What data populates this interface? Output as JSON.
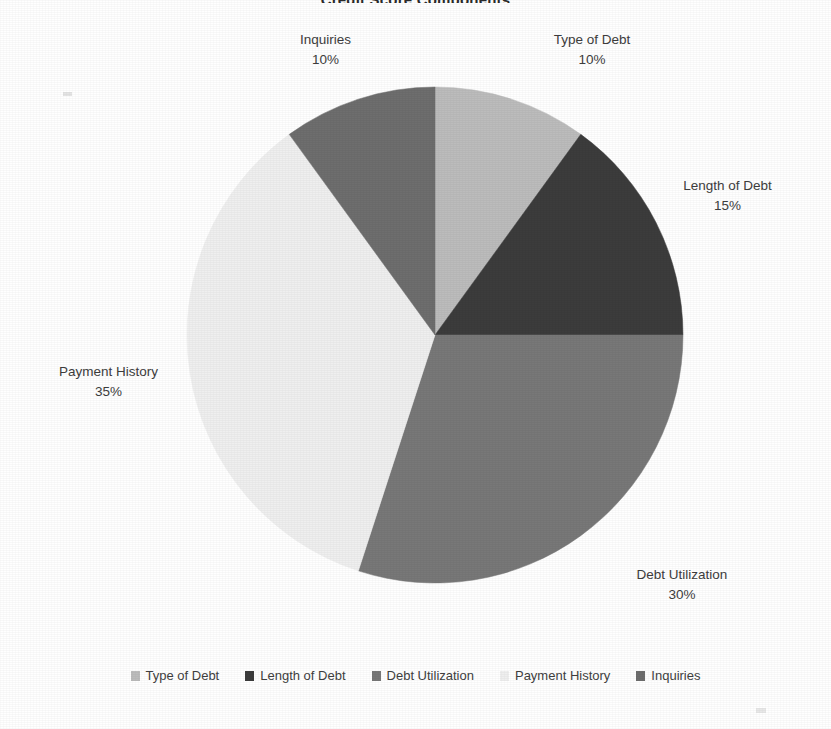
{
  "title": "Credit Score Components",
  "chart_data": {
    "type": "pie",
    "title": "Credit Score Components",
    "categories": [
      "Type of Debt",
      "Length of Debt",
      "Debt Utilization",
      "Payment History",
      "Inquiries"
    ],
    "values": [
      10,
      15,
      30,
      35,
      10
    ],
    "value_labels": [
      "10%",
      "15%",
      "30%",
      "35%",
      "10%"
    ],
    "unit": "%",
    "start_angle_deg": 0,
    "direction": "clockwise",
    "legend_position": "bottom",
    "grid": false,
    "colors": [
      "#bcbcbc",
      "#3c3c3c",
      "#787878",
      "#efefef",
      "#6e6e6e"
    ],
    "slices": [
      {
        "label": "Type of Debt",
        "value": 10,
        "value_label": "10%",
        "color": "#bcbcbc",
        "start_deg": 0,
        "end_deg": 36
      },
      {
        "label": "Length of Debt",
        "value": 15,
        "value_label": "15%",
        "color": "#3c3c3c",
        "start_deg": 36,
        "end_deg": 90
      },
      {
        "label": "Debt Utilization",
        "value": 30,
        "value_label": "30%",
        "color": "#787878",
        "start_deg": 90,
        "end_deg": 198
      },
      {
        "label": "Payment History",
        "value": 35,
        "value_label": "35%",
        "color": "#efefef",
        "start_deg": 198,
        "end_deg": 324
      },
      {
        "label": "Inquiries",
        "value": 10,
        "value_label": "10%",
        "color": "#6e6e6e",
        "start_deg": 324,
        "end_deg": 360
      }
    ]
  },
  "labels": {
    "type_of_debt": {
      "name": "Type of Debt",
      "pct": "10%"
    },
    "length_of_debt": {
      "name": "Length of Debt",
      "pct": "15%"
    },
    "debt_utilization": {
      "name": "Debt Utilization",
      "pct": "30%"
    },
    "payment_history": {
      "name": "Payment History",
      "pct": "35%"
    },
    "inquiries": {
      "name": "Inquiries",
      "pct": "10%"
    }
  },
  "legend": {
    "items": [
      {
        "label": "Type of Debt",
        "color": "#bcbcbc"
      },
      {
        "label": "Length of Debt",
        "color": "#3c3c3c"
      },
      {
        "label": "Debt Utilization",
        "color": "#787878"
      },
      {
        "label": "Payment History",
        "color": "#efefef"
      },
      {
        "label": "Inquiries",
        "color": "#6e6e6e"
      }
    ]
  }
}
